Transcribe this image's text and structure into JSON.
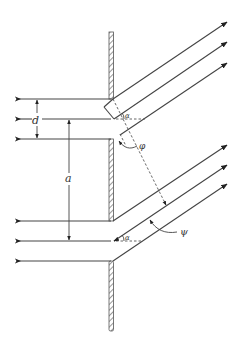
{
  "diagram": {
    "type": "double-slit diffraction geometry (two slits in a screen, parallel incident rays, oblique diffracted rays)",
    "labels": {
      "slit_width": "d",
      "slit_separation": "a",
      "angle_phi": "φ",
      "angle_psi": "ψ",
      "angle_alpha_upper": "α",
      "angle_alpha_lower": "α"
    },
    "colors": {
      "line": "#444444",
      "background": "#ffffff"
    },
    "incident_rays_per_slit": 3,
    "diffracted_rays_per_slit": 3
  }
}
